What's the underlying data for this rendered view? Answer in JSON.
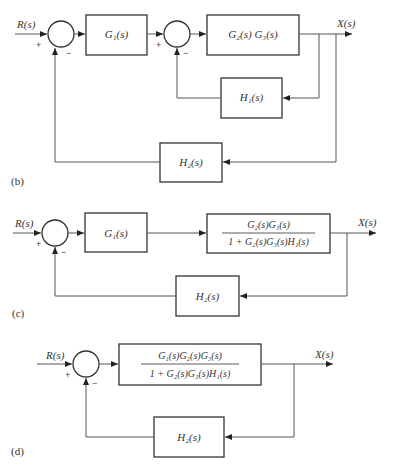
{
  "diagrams": {
    "b": {
      "panel_label": "(b)",
      "input_label": "R(s)",
      "output_label": "X(s)",
      "sum1": {
        "plus": "+",
        "minus": "−"
      },
      "sum2": {
        "plus": "+",
        "minus": "−"
      },
      "block_g1": "G₁(s)",
      "block_g2g3": "G₂(s) G₃(s)",
      "block_h1": "H₁(s)",
      "block_h2": "H₂(s)"
    },
    "c": {
      "panel_label": "(c)",
      "input_label": "R(s)",
      "output_label": "X(s)",
      "sum1": {
        "plus": "+",
        "minus": "−"
      },
      "block_g1": "G₁(s)",
      "block_closed_inner": {
        "numerator": "G₂(s)G₃(s)",
        "denominator": "1 + G₂(s)G₃(s)H₁(s)"
      },
      "block_h2": "H₂(s)"
    },
    "d": {
      "panel_label": "(d)",
      "input_label": "R(s)",
      "output_label": "X(s)",
      "sum1": {
        "plus": "+",
        "minus": "−"
      },
      "block_forward": {
        "numerator": "G₁(s)G₂(s)G₃(s)",
        "denominator": "1 + G₂(s)G₃(s)H₁(s)"
      },
      "block_h2": "H₂(s)"
    }
  }
}
